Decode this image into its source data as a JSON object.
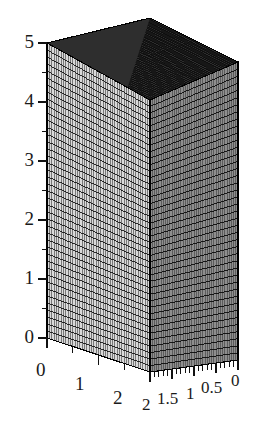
{
  "figure": {
    "type": "3d-mesh-box-plot",
    "background_color": "#ffffff",
    "line_color": "#111111"
  },
  "chart_data": {
    "type": "surface",
    "title": "",
    "xlabel": "",
    "ylabel": "",
    "zlabel": "",
    "projection": "axonometric",
    "xlim": [
      0,
      2
    ],
    "ylim": [
      0,
      2
    ],
    "zlim": [
      0,
      5
    ],
    "constant_value": 5,
    "grid": true,
    "legend": false,
    "faces": {
      "top": {
        "name": "top-face",
        "fill": "#2b2b2b",
        "mesh_density": "fine"
      },
      "left": {
        "name": "left-front-face",
        "fill": "#d6d6d6",
        "mesh_density": "fine"
      },
      "right": {
        "name": "right-front-face",
        "fill": "#8a8a8a",
        "mesh_density": "fine"
      }
    },
    "axes": {
      "z": {
        "name": "z-axis",
        "ticks": [
          0,
          1,
          2,
          3,
          4,
          5
        ],
        "tick_labels": [
          "0",
          "1",
          "2",
          "3",
          "4",
          "5"
        ],
        "minor_ticks_between": 1,
        "direction": "vertical-left"
      },
      "x": {
        "name": "x-axis",
        "ticks": [
          0,
          1,
          2
        ],
        "tick_labels": [
          "0",
          "1",
          "2"
        ],
        "minor_ticks_between": 1,
        "direction": "bottom-left-to-front"
      },
      "y": {
        "name": "y-axis",
        "ticks": [
          2,
          1.5,
          1,
          0.5,
          0
        ],
        "tick_labels": [
          "2",
          "1.5",
          "1",
          "0.5",
          "0"
        ],
        "minor_ticks_between": 4,
        "direction": "front-to-bottom-right"
      }
    }
  },
  "z_axis_labels": [
    {
      "text": "5",
      "value": 5
    },
    {
      "text": "4",
      "value": 4
    },
    {
      "text": "3",
      "value": 3
    },
    {
      "text": "2",
      "value": 2
    },
    {
      "text": "1",
      "value": 1
    },
    {
      "text": "0",
      "value": 0
    }
  ],
  "x_axis_labels": [
    {
      "text": "0",
      "value": 0
    },
    {
      "text": "1",
      "value": 1
    },
    {
      "text": "2",
      "value": 2
    }
  ],
  "y_axis_labels": [
    {
      "text": "2",
      "value": 2
    },
    {
      "text": "1.5",
      "value": 1.5
    },
    {
      "text": "1",
      "value": 1
    },
    {
      "text": "0.5",
      "value": 0.5
    },
    {
      "text": "0",
      "value": 0
    }
  ]
}
